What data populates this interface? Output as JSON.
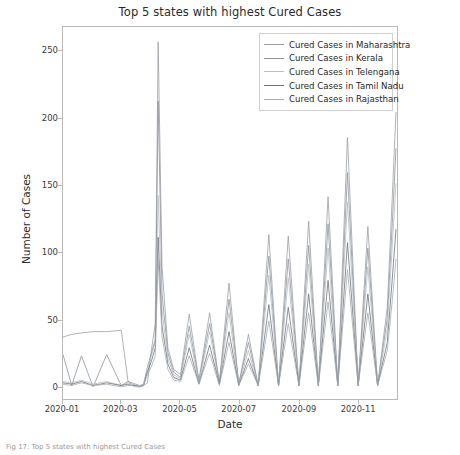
{
  "figure": {
    "caption": "Fig 17: Top 5 states with highest Cured Cases"
  },
  "chart_data": {
    "type": "line",
    "title": "Top 5 states with highest Cured Cases",
    "xlabel": "Date",
    "ylabel": "Number of Cases",
    "grid": false,
    "legend_position": "upper right",
    "xlim": [
      "2020-01-01",
      "2020-12-10"
    ],
    "ylim": [
      -8,
      268
    ],
    "yticks": [
      0,
      50,
      100,
      150,
      200,
      250
    ],
    "xticks": [
      "2020-01",
      "2020-03",
      "2020-05",
      "2020-07",
      "2020-09",
      "2020-11"
    ],
    "colors": {
      "maharashtra": "#9aa0a6",
      "kerala": "#8e949a",
      "telengana": "#b9bec3",
      "tamil_nadu": "#6f757b",
      "rajasthan": "#a7acb1"
    },
    "series": [
      {
        "name": "Cured Cases in Maharashtra",
        "color": "#9aa0a6",
        "x": [
          "2020-01-01",
          "2020-01-10",
          "2020-01-20",
          "2020-02-01",
          "2020-02-15",
          "2020-03-01",
          "2020-03-08",
          "2020-03-12",
          "2020-03-16",
          "2020-03-20",
          "2020-03-24",
          "2020-03-28",
          "2020-04-01",
          "2020-04-05",
          "2020-04-08",
          "2020-04-12",
          "2020-04-18",
          "2020-04-24",
          "2020-05-01",
          "2020-05-10",
          "2020-05-20",
          "2020-05-31",
          "2020-06-10",
          "2020-06-20",
          "2020-06-30",
          "2020-07-10",
          "2020-07-20",
          "2020-07-31",
          "2020-08-10",
          "2020-08-20",
          "2020-08-31",
          "2020-09-10",
          "2020-09-20",
          "2020-09-30",
          "2020-10-10",
          "2020-10-20",
          "2020-10-31",
          "2020-11-10",
          "2020-11-20",
          "2020-11-30",
          "2020-12-05",
          "2020-12-09"
        ],
        "y": [
          38,
          40,
          41,
          42,
          42,
          43,
          5,
          4,
          3,
          2,
          2,
          4,
          28,
          48,
          257,
          90,
          30,
          14,
          10,
          55,
          6,
          56,
          4,
          78,
          3,
          40,
          2,
          114,
          2,
          113,
          2,
          124,
          2,
          142,
          2,
          186,
          2,
          120,
          2,
          60,
          140,
          205
        ]
      },
      {
        "name": "Cured Cases in Kerala",
        "color": "#8e949a",
        "x": [
          "2020-01-01",
          "2020-01-10",
          "2020-01-20",
          "2020-02-01",
          "2020-02-15",
          "2020-03-01",
          "2020-03-08",
          "2020-03-12",
          "2020-03-16",
          "2020-03-20",
          "2020-03-24",
          "2020-03-28",
          "2020-04-01",
          "2020-04-05",
          "2020-04-08",
          "2020-04-12",
          "2020-04-18",
          "2020-04-24",
          "2020-05-01",
          "2020-05-10",
          "2020-05-20",
          "2020-05-31",
          "2020-06-10",
          "2020-06-20",
          "2020-06-30",
          "2020-07-10",
          "2020-07-20",
          "2020-07-31",
          "2020-08-10",
          "2020-08-20",
          "2020-08-31",
          "2020-09-10",
          "2020-09-20",
          "2020-09-30",
          "2020-10-10",
          "2020-10-20",
          "2020-10-31",
          "2020-11-10",
          "2020-11-20",
          "2020-11-30",
          "2020-12-05",
          "2020-12-09"
        ],
        "y": [
          25,
          2,
          24,
          1,
          25,
          2,
          5,
          3,
          2,
          2,
          3,
          16,
          26,
          36,
          213,
          70,
          26,
          12,
          8,
          46,
          5,
          48,
          4,
          66,
          3,
          34,
          2,
          98,
          2,
          96,
          2,
          106,
          2,
          122,
          2,
          160,
          2,
          104,
          2,
          52,
          120,
          178
        ]
      },
      {
        "name": "Cured Cases in Telengana",
        "color": "#b9bec3",
        "x": [
          "2020-01-01",
          "2020-01-10",
          "2020-01-20",
          "2020-02-01",
          "2020-02-15",
          "2020-03-01",
          "2020-03-08",
          "2020-03-12",
          "2020-03-16",
          "2020-03-20",
          "2020-03-24",
          "2020-03-28",
          "2020-04-01",
          "2020-04-05",
          "2020-04-08",
          "2020-04-12",
          "2020-04-18",
          "2020-04-24",
          "2020-05-01",
          "2020-05-10",
          "2020-05-20",
          "2020-05-31",
          "2020-06-10",
          "2020-06-20",
          "2020-06-30",
          "2020-07-10",
          "2020-07-20",
          "2020-07-31",
          "2020-08-10",
          "2020-08-20",
          "2020-08-31",
          "2020-09-10",
          "2020-09-20",
          "2020-09-30",
          "2020-10-10",
          "2020-10-20",
          "2020-10-31",
          "2020-11-10",
          "2020-11-20",
          "2020-11-30",
          "2020-12-05",
          "2020-12-09"
        ],
        "y": [
          5,
          4,
          6,
          3,
          5,
          2,
          4,
          3,
          2,
          2,
          3,
          14,
          24,
          34,
          143,
          58,
          22,
          10,
          7,
          40,
          4,
          42,
          3,
          56,
          2,
          28,
          2,
          84,
          2,
          82,
          2,
          92,
          2,
          104,
          2,
          138,
          2,
          90,
          2,
          44,
          104,
          152
        ]
      },
      {
        "name": "Cured Cases in Tamil Nadu",
        "color": "#6f757b",
        "x": [
          "2020-01-01",
          "2020-01-10",
          "2020-01-20",
          "2020-02-01",
          "2020-02-15",
          "2020-03-01",
          "2020-03-08",
          "2020-03-12",
          "2020-03-16",
          "2020-03-20",
          "2020-03-24",
          "2020-03-28",
          "2020-04-01",
          "2020-04-05",
          "2020-04-08",
          "2020-04-12",
          "2020-04-18",
          "2020-04-24",
          "2020-05-01",
          "2020-05-10",
          "2020-05-20",
          "2020-05-31",
          "2020-06-10",
          "2020-06-20",
          "2020-06-30",
          "2020-07-10",
          "2020-07-20",
          "2020-07-31",
          "2020-08-10",
          "2020-08-20",
          "2020-08-31",
          "2020-09-10",
          "2020-09-20",
          "2020-09-30",
          "2020-10-10",
          "2020-10-20",
          "2020-10-31",
          "2020-11-10",
          "2020-11-20",
          "2020-11-30",
          "2020-12-05",
          "2020-12-09"
        ],
        "y": [
          4,
          3,
          5,
          2,
          4,
          2,
          3,
          2,
          2,
          1,
          2,
          12,
          20,
          30,
          112,
          46,
          18,
          8,
          6,
          30,
          3,
          32,
          3,
          42,
          2,
          22,
          2,
          62,
          2,
          60,
          2,
          70,
          2,
          80,
          2,
          108,
          2,
          70,
          2,
          34,
          80,
          118
        ]
      },
      {
        "name": "Cured Cases in Rajasthan",
        "color": "#a7acb1",
        "x": [
          "2020-01-01",
          "2020-01-10",
          "2020-01-20",
          "2020-02-01",
          "2020-02-15",
          "2020-03-01",
          "2020-03-08",
          "2020-03-12",
          "2020-03-16",
          "2020-03-20",
          "2020-03-24",
          "2020-03-28",
          "2020-04-01",
          "2020-04-05",
          "2020-04-08",
          "2020-04-12",
          "2020-04-18",
          "2020-04-24",
          "2020-05-01",
          "2020-05-10",
          "2020-05-20",
          "2020-05-31",
          "2020-06-10",
          "2020-06-20",
          "2020-06-30",
          "2020-07-10",
          "2020-07-20",
          "2020-07-31",
          "2020-08-10",
          "2020-08-20",
          "2020-08-31",
          "2020-09-10",
          "2020-09-20",
          "2020-09-30",
          "2020-10-10",
          "2020-10-20",
          "2020-10-31",
          "2020-11-10",
          "2020-11-20",
          "2020-11-30",
          "2020-12-05",
          "2020-12-09"
        ],
        "y": [
          3,
          2,
          4,
          2,
          3,
          1,
          2,
          2,
          1,
          1,
          2,
          10,
          16,
          24,
          96,
          38,
          14,
          6,
          5,
          24,
          3,
          26,
          2,
          34,
          2,
          18,
          2,
          50,
          2,
          48,
          2,
          56,
          2,
          64,
          2,
          88,
          2,
          56,
          2,
          28,
          64,
          96
        ]
      }
    ]
  },
  "legend": {
    "items": [
      {
        "label": "Cured Cases in Maharashtra",
        "color": "#9aa0a6"
      },
      {
        "label": "Cured Cases in Kerala",
        "color": "#8e949a"
      },
      {
        "label": "Cured Cases in Telengana",
        "color": "#b9bec3"
      },
      {
        "label": "Cured Cases in Tamil Nadu",
        "color": "#6f757b"
      },
      {
        "label": "Cured Cases in Rajasthan",
        "color": "#a7acb1"
      }
    ]
  }
}
